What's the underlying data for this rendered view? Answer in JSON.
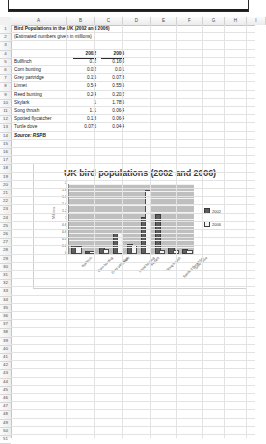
{
  "spreadsheet": {
    "column_headers": [
      "A",
      "B",
      "C",
      "D",
      "E",
      "F",
      "G",
      "H",
      "I"
    ],
    "row_numbers": [
      1,
      2,
      3,
      4,
      5,
      6,
      7,
      8,
      9,
      10,
      11,
      12,
      13,
      14,
      15,
      16,
      17,
      18,
      19,
      20,
      21,
      22,
      23,
      24,
      25,
      26,
      27,
      28,
      29,
      30,
      31,
      32,
      33,
      34,
      35,
      36,
      37,
      38,
      39,
      40,
      41,
      42,
      43,
      44,
      45,
      46,
      47,
      48,
      49,
      50,
      51
    ],
    "cells": {
      "a1": "Bird Populations in the UK (2002 and 2006)",
      "a2": "(Estimated numbers given in millions)",
      "b4": "2002",
      "c4": "2006",
      "a14": "Source: RSPB"
    },
    "table_rows": [
      {
        "row": 5,
        "name": "Bullfinch",
        "v2002": "0.2",
        "v2006": "0.166"
      },
      {
        "row": 6,
        "name": "Corn bunting",
        "v2002": "0.02",
        "v2006": "0.01"
      },
      {
        "row": 7,
        "name": "Grey partridge",
        "v2002": "0.15",
        "v2006": "0.073"
      },
      {
        "row": 8,
        "name": "Linnet",
        "v2002": "0.54",
        "v2006": "0.556"
      },
      {
        "row": 9,
        "name": "Reed bunting",
        "v2002": "0.24",
        "v2006": "0.202"
      },
      {
        "row": 10,
        "name": "Skylark",
        "v2002": "1",
        "v2006": "1.785"
      },
      {
        "row": 11,
        "name": "Song thrush",
        "v2002": "1.1",
        "v2006": "0.064"
      },
      {
        "row": 12,
        "name": "Spotted flycatcher",
        "v2002": "0.13",
        "v2006": "0.064"
      },
      {
        "row": 13,
        "name": "Turtle dove",
        "v2002": "0.075",
        "v2006": "0.044"
      }
    ]
  },
  "chart_data": {
    "type": "bar",
    "title": "UK bird populations (2002 and 2006)",
    "xlabel": "",
    "ylabel": "Millions",
    "ylim": [
      0,
      2
    ],
    "ytick_labels": [
      "0",
      "0.2",
      "0.4",
      "0.6",
      "0.8",
      "1",
      "1.2",
      "1.4",
      "1.6",
      "1.8",
      "2"
    ],
    "grid": true,
    "legend_position": "right",
    "categories": [
      "Bullfinch",
      "Corn bunting",
      "Grey partridge",
      "Linnet",
      "Reed bunting",
      "Skylark",
      "Song thrush",
      "Spotted flycatcher",
      "Turtle dove"
    ],
    "series": [
      {
        "name": "2002",
        "color": "#5e5e5e",
        "values": [
          0.2,
          0.02,
          0.15,
          0.54,
          0.24,
          1,
          1.1,
          0.13,
          0.075
        ]
      },
      {
        "name": "2006",
        "color": "#f4f4f4",
        "values": [
          0.166,
          0.01,
          0.073,
          0.556,
          0.202,
          1.785,
          0.064,
          0.064,
          0.044
        ]
      }
    ]
  }
}
